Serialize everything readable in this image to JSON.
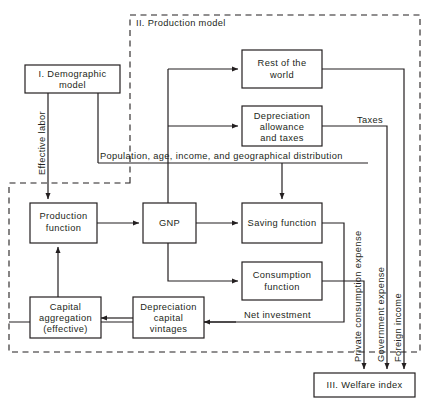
{
  "diagram": {
    "regions": [
      {
        "id": "production_model",
        "label": "II. Production model"
      }
    ],
    "boxes": {
      "demographic": {
        "line1": "I. Demographic",
        "line2": "model"
      },
      "rest_of_world": {
        "line1": "Rest of  the",
        "line2": "world"
      },
      "depreciation_taxes": {
        "line1": "Depreciation",
        "line2": "allowance",
        "line3": "and  taxes"
      },
      "production_function": {
        "line1": "Production",
        "line2": "function"
      },
      "gnp": {
        "line1": "GNP"
      },
      "saving_function": {
        "line1": "Saving  function"
      },
      "consumption_function": {
        "line1": "Consumption",
        "line2": "function"
      },
      "capital_aggregation": {
        "line1": "Capital",
        "line2": "aggregation",
        "line3": "(effective)"
      },
      "depreciation_vintages": {
        "line1": "Depreciation",
        "line2": "capital",
        "line3": "vintages"
      },
      "welfare_index": {
        "line1": "III.  Welfare  index"
      }
    },
    "edge_labels": {
      "effective_labor": "Effective labor",
      "population": "Population, age, income, and geographical distribution",
      "taxes": "Taxes",
      "net_investment": "Net  investment",
      "private_consumption_expense": "Private consumption expense",
      "government_expense": "Government expense",
      "foreign_income": "Foreign income"
    },
    "colors": {
      "ink": "#231f20",
      "paper": "#ffffff"
    }
  }
}
